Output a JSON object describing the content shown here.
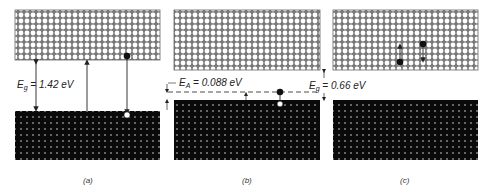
{
  "figure": {
    "panels": [
      {
        "id": "a",
        "caption": "(a)",
        "gap_label_main": "E",
        "gap_label_sub": "g",
        "gap_label_value": " = 1.42 eV",
        "description": "Direct band gap: electron excitation and recombination across 1.42 eV gap"
      },
      {
        "id": "b",
        "caption": "(b)",
        "acceptor_label_main": "E",
        "acceptor_label_sub": "A",
        "acceptor_label_value": " = 0.088 eV",
        "description": "Acceptor level 0.088 eV above valence band with electron trapped at acceptor"
      },
      {
        "id": "c",
        "caption": "(c)",
        "gap_label_main": "E",
        "gap_label_sub": "g",
        "gap_label_value": " = 0.66 eV",
        "description": "Electrons moving within conduction band"
      }
    ],
    "colors": {
      "conduction_band_fill": "#ffffff",
      "conduction_band_stroke": "#555555",
      "valence_band_fill": "#0a0a0a",
      "valence_dot": "#dddddd",
      "line": "#222222"
    }
  }
}
